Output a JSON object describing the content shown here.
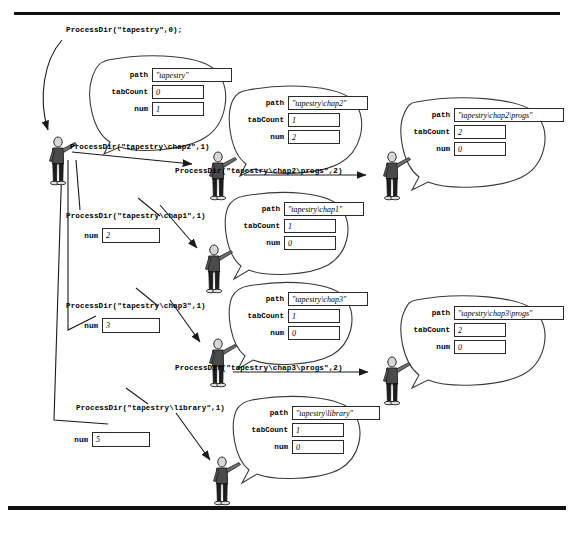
{
  "page": {
    "rule_color": "#111111"
  },
  "root_call": {
    "label": "ProcessDir(\"tapestry\",0);"
  },
  "labels": {
    "path": "path",
    "tabCount": "tabCount",
    "num": "num"
  },
  "calls": [
    {
      "id": "call-chap2",
      "label": "ProcessDir(\"tapestry\\chap2\",1)"
    },
    {
      "id": "call-chap2-progs",
      "label": "ProcessDir(\"tapestry\\chap2\\progs\",2)"
    },
    {
      "id": "call-chap1",
      "label": "ProcessDir(\"tapestry\\chap1\",1)"
    },
    {
      "id": "call-chap3",
      "label": "ProcessDir(\"tapestry\\chap3\",1)"
    },
    {
      "id": "call-chap3-progs",
      "label": "ProcessDir(\"tapestry\\chap3\\progs\",2)"
    },
    {
      "id": "call-library",
      "label": "ProcessDir(\"tapestry\\library\",1)"
    }
  ],
  "frames": [
    {
      "id": "frame-tapestry",
      "path": "\"tapestry\"",
      "tabCount": "0",
      "num": "1"
    },
    {
      "id": "frame-chap2",
      "path": "\"tapestry\\chap2\"",
      "tabCount": "1",
      "num": "2"
    },
    {
      "id": "frame-chap2-progs",
      "path": "\"tapestry\\chap2\\progs\"",
      "tabCount": "2",
      "num": "0"
    },
    {
      "id": "frame-chap1",
      "path": "\"tapestry\\chap1\"",
      "tabCount": "1",
      "num": "0"
    },
    {
      "id": "frame-chap3",
      "path": "\"tapestry\\chap3\"",
      "tabCount": "1",
      "num": "0"
    },
    {
      "id": "frame-chap3-progs",
      "path": "\"tapestry\\chap3\\progs\"",
      "tabCount": "2",
      "num": "0"
    },
    {
      "id": "frame-library",
      "path": "\"tapestry\\library\"",
      "tabCount": "1",
      "num": "0"
    }
  ],
  "loose_values": [
    {
      "id": "num-chap1",
      "name": "num",
      "value": "2"
    },
    {
      "id": "num-chap3",
      "name": "num",
      "value": "3"
    },
    {
      "id": "num-library",
      "name": "num",
      "value": "5"
    }
  ]
}
